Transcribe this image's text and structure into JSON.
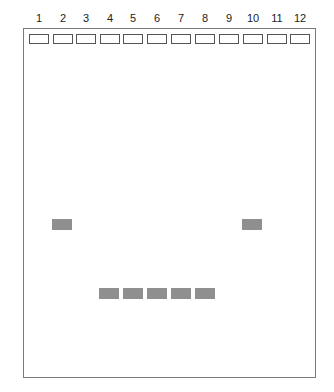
{
  "gel": {
    "lanes": [
      "1",
      "2",
      "3",
      "4",
      "5",
      "6",
      "7",
      "8",
      "9",
      "10",
      "11",
      "12"
    ],
    "band_color": "#8f8f8f",
    "bands": [
      {
        "lane": "2",
        "position": "upper"
      },
      {
        "lane": "10",
        "position": "upper"
      },
      {
        "lane": "4",
        "position": "lower"
      },
      {
        "lane": "5",
        "position": "lower"
      },
      {
        "lane": "6",
        "position": "lower"
      },
      {
        "lane": "7",
        "position": "lower"
      },
      {
        "lane": "8",
        "position": "lower"
      }
    ]
  }
}
